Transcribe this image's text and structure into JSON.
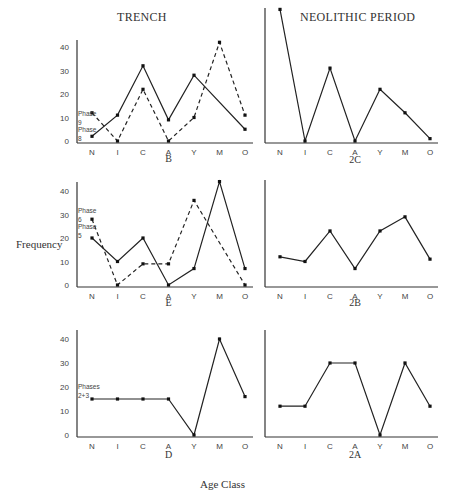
{
  "headers": {
    "left": "TRENCH",
    "right": "NEOLITHIC PERIOD"
  },
  "axis_labels": {
    "y": "Frequency",
    "x": "Age Class"
  },
  "chart_data": [
    {
      "id": "B",
      "type": "line",
      "title": "B",
      "column": "TRENCH",
      "categories": [
        "N",
        "I",
        "C",
        "A",
        "Y",
        "M",
        "O"
      ],
      "yticks": [
        0,
        10,
        20,
        30,
        40
      ],
      "ylim": [
        0,
        44
      ],
      "series": [
        {
          "name": "Phase 8",
          "style": "solid",
          "values": [
            2,
            11,
            32,
            9,
            28,
            null,
            5
          ],
          "line_through_missing": true
        },
        {
          "name": "Phase 9",
          "style": "dashed",
          "values": [
            12,
            0,
            22,
            0,
            10,
            42,
            11
          ]
        }
      ],
      "annotations": [
        {
          "text_lines": [
            "Phase",
            "9"
          ],
          "series": "Phase 9"
        },
        {
          "text_lines": [
            "Phase",
            "8"
          ],
          "series": "Phase 8"
        }
      ]
    },
    {
      "id": "2C",
      "type": "line",
      "title": "2C",
      "column": "NEOLITHIC PERIOD",
      "categories": [
        "N",
        "I",
        "C",
        "A",
        "Y",
        "M",
        "O"
      ],
      "yticks": [],
      "ylim": [
        0,
        57
      ],
      "series": [
        {
          "name": "Neolithic",
          "style": "solid",
          "values": [
            56,
            0,
            31,
            0,
            22,
            12,
            1
          ]
        }
      ]
    },
    {
      "id": "E",
      "type": "line",
      "title": "E",
      "column": "TRENCH",
      "categories": [
        "N",
        "I",
        "C",
        "A",
        "Y",
        "M",
        "O"
      ],
      "yticks": [
        0,
        10,
        20,
        30,
        40
      ],
      "ylim": [
        0,
        44
      ],
      "series": [
        {
          "name": "Phase 5",
          "style": "solid",
          "values": [
            20,
            10,
            20,
            0,
            7,
            44,
            7
          ]
        },
        {
          "name": "Phase 6",
          "style": "dashed",
          "values": [
            28,
            0,
            9,
            9,
            36,
            null,
            0
          ],
          "line_through_missing": true
        }
      ],
      "annotations": [
        {
          "text_lines": [
            "Phase",
            "6"
          ],
          "series": "Phase 6"
        },
        {
          "text_lines": [
            "Phase",
            "5"
          ],
          "series": "Phase 5"
        }
      ]
    },
    {
      "id": "2B",
      "type": "line",
      "title": "2B",
      "column": "NEOLITHIC PERIOD",
      "categories": [
        "N",
        "I",
        "C",
        "A",
        "Y",
        "M",
        "O"
      ],
      "yticks": [],
      "ylim": [
        0,
        44
      ],
      "series": [
        {
          "name": "Neolithic",
          "style": "solid",
          "values": [
            12,
            10,
            23,
            7,
            23,
            29,
            11
          ]
        }
      ]
    },
    {
      "id": "D",
      "type": "line",
      "title": "D",
      "column": "TRENCH",
      "categories": [
        "N",
        "I",
        "C",
        "A",
        "Y",
        "M",
        "O"
      ],
      "yticks": [
        0,
        10,
        20,
        30,
        40
      ],
      "ylim": [
        0,
        44
      ],
      "series": [
        {
          "name": "Phases 2+3",
          "style": "solid",
          "values": [
            15,
            15,
            15,
            15,
            0,
            40,
            16
          ]
        }
      ],
      "annotations": [
        {
          "text_lines": [
            "Phases",
            "2+3"
          ],
          "series": "Phases 2+3"
        }
      ]
    },
    {
      "id": "2A",
      "type": "line",
      "title": "2A",
      "column": "NEOLITHIC PERIOD",
      "categories": [
        "N",
        "I",
        "C",
        "A",
        "Y",
        "M",
        "O"
      ],
      "yticks": [],
      "ylim": [
        0,
        44
      ],
      "series": [
        {
          "name": "Neolithic",
          "style": "solid",
          "values": [
            12,
            12,
            30,
            30,
            0,
            30,
            12
          ]
        }
      ]
    }
  ]
}
